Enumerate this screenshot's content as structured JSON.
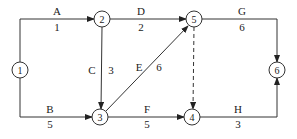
{
  "diagram": {
    "type": "activity-on-arrow network",
    "nodes": [
      {
        "id": "1",
        "label": "1"
      },
      {
        "id": "2",
        "label": "2"
      },
      {
        "id": "3",
        "label": "3"
      },
      {
        "id": "4",
        "label": "4"
      },
      {
        "id": "5",
        "label": "5"
      },
      {
        "id": "6",
        "label": "6"
      }
    ],
    "edges": [
      {
        "activity": "A",
        "duration": "1",
        "from": "1",
        "to": "2",
        "style": "solid"
      },
      {
        "activity": "B",
        "duration": "5",
        "from": "1",
        "to": "3",
        "style": "solid"
      },
      {
        "activity": "C",
        "duration": "3",
        "from": "2",
        "to": "3",
        "style": "solid"
      },
      {
        "activity": "D",
        "duration": "2",
        "from": "2",
        "to": "5",
        "style": "solid"
      },
      {
        "activity": "E",
        "duration": "6",
        "from": "3",
        "to": "5",
        "style": "solid"
      },
      {
        "activity": "F",
        "duration": "5",
        "from": "3",
        "to": "4",
        "style": "solid"
      },
      {
        "activity": "G",
        "duration": "6",
        "from": "5",
        "to": "6",
        "style": "solid"
      },
      {
        "activity": "H",
        "duration": "3",
        "from": "4",
        "to": "6",
        "style": "solid"
      },
      {
        "activity": "",
        "duration": "",
        "from": "5",
        "to": "4",
        "style": "dashed"
      }
    ]
  }
}
